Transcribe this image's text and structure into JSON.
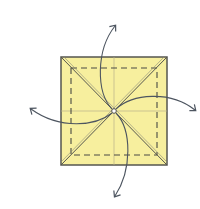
{
  "diagram": {
    "type": "origami-fold-diagram",
    "paper_color": "#f7ef9e",
    "edge_color": "#55564f",
    "crease_color": "#7a7a6a",
    "arrow_color": "#4d5560",
    "square": {
      "x": 61,
      "y": 57,
      "size": 106
    },
    "center": {
      "x": 114,
      "y": 111
    },
    "dashed_inset": 10,
    "arrows": [
      {
        "direction": "up",
        "label": "unfold-top-flap"
      },
      {
        "direction": "right",
        "label": "unfold-right-flap"
      },
      {
        "direction": "down",
        "label": "unfold-bottom-flap"
      },
      {
        "direction": "left",
        "label": "unfold-left-flap"
      }
    ]
  }
}
